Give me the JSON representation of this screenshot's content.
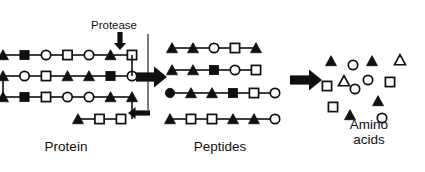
{
  "figure": {
    "stages": [
      {
        "id": "protein",
        "label": "Protein"
      },
      {
        "id": "peptides",
        "label": "Peptides"
      },
      {
        "id": "amino",
        "label": "Amino\nacids"
      }
    ],
    "annotation": {
      "protease_label": "Protease"
    },
    "colors": {
      "filled": "#101010",
      "open_fill": "#ffffff",
      "stroke": "#101010",
      "bond": "#101010",
      "text": "#111111",
      "background": "#ffffff"
    },
    "glyph_legend": [
      {
        "name": "filled-triangle",
        "shape": "triangle",
        "fill": "filled"
      },
      {
        "name": "open-triangle",
        "shape": "triangle",
        "fill": "open"
      },
      {
        "name": "filled-square",
        "shape": "square",
        "fill": "filled"
      },
      {
        "name": "open-square",
        "shape": "square",
        "fill": "open"
      },
      {
        "name": "filled-circle",
        "shape": "circle",
        "fill": "filled"
      },
      {
        "name": "open-circle",
        "shape": "circle",
        "fill": "open"
      }
    ]
  },
  "protein": {
    "rows": [
      {
        "y": 55,
        "x_start": 3,
        "spacing": 21.5,
        "residues": [
          "filled-triangle",
          "filled-square",
          "open-circle",
          "open-square",
          "open-circle",
          "filled-triangle",
          "open-square"
        ]
      },
      {
        "y": 76,
        "x_start": 3,
        "spacing": 21.5,
        "residues": [
          "filled-triangle",
          "open-circle",
          "open-square",
          "filled-triangle",
          "filled-triangle",
          "filled-square",
          "open-circle"
        ]
      },
      {
        "y": 97,
        "x_start": 3,
        "spacing": 21.5,
        "residues": [
          "filled-triangle",
          "filled-square",
          "open-square",
          "open-circle",
          "open-circle",
          "filled-triangle",
          "filled-triangle"
        ]
      },
      {
        "y": 119,
        "x_start": 78,
        "spacing": 21.5,
        "residues": [
          "filled-triangle",
          "open-square",
          "open-square"
        ]
      }
    ],
    "folds": [
      {
        "from_row": 0,
        "to_row": 1,
        "x": 132
      },
      {
        "from_row": 1,
        "to_row": 2,
        "x": 3
      },
      {
        "from_row": 2,
        "to_row": 3,
        "x": 132
      }
    ],
    "protease_arrow": {
      "x": 120,
      "y_top": 32,
      "y_tip": 50,
      "direction": "down"
    },
    "cleavage_arrow": {
      "x_tail": 150,
      "x_tip": 128,
      "y": 113,
      "direction": "left"
    },
    "guide_line": {
      "x": 148,
      "y_top": 34,
      "y_bottom": 110
    }
  },
  "peptides": {
    "rows": [
      {
        "y": 48,
        "x_start": 172,
        "spacing": 21,
        "residues": [
          "filled-triangle",
          "filled-triangle",
          "open-circle",
          "open-square",
          "filled-triangle"
        ]
      },
      {
        "y": 70,
        "x_start": 172,
        "spacing": 21,
        "residues": [
          "filled-triangle",
          "filled-triangle",
          "filled-square",
          "open-circle",
          "open-square"
        ]
      },
      {
        "y": 93,
        "x_start": 170,
        "spacing": 21,
        "residues": [
          "filled-circle",
          "filled-triangle",
          "filled-triangle",
          "filled-square",
          "open-square",
          "open-circle"
        ]
      },
      {
        "y": 119,
        "x_start": 170,
        "spacing": 21,
        "residues": [
          "filled-triangle",
          "open-square",
          "open-square",
          "filled-triangle",
          "filled-triangle",
          "open-circle"
        ]
      }
    ]
  },
  "amino_acids": {
    "items": [
      {
        "glyph": "filled-triangle",
        "x": 331,
        "y": 61
      },
      {
        "glyph": "open-circle",
        "x": 353,
        "y": 65
      },
      {
        "glyph": "filled-triangle",
        "x": 372,
        "y": 61
      },
      {
        "glyph": "open-triangle",
        "x": 400,
        "y": 60
      },
      {
        "glyph": "open-square",
        "x": 327,
        "y": 86
      },
      {
        "glyph": "open-triangle",
        "x": 344,
        "y": 81
      },
      {
        "glyph": "open-circle",
        "x": 368,
        "y": 80
      },
      {
        "glyph": "open-square",
        "x": 390,
        "y": 82
      },
      {
        "glyph": "open-circle",
        "x": 355,
        "y": 89
      },
      {
        "glyph": "open-square",
        "x": 333,
        "y": 107
      },
      {
        "glyph": "filled-triangle",
        "x": 378,
        "y": 101
      },
      {
        "glyph": "filled-triangle",
        "x": 350,
        "y": 115
      },
      {
        "glyph": "open-circle",
        "x": 382,
        "y": 118
      }
    ]
  },
  "transition_arrows": [
    {
      "name": "protein-to-peptides",
      "x_tail": 136,
      "x_tip": 167,
      "y": 77
    },
    {
      "name": "peptides-to-amino",
      "x_tail": 290,
      "x_tip": 322,
      "y": 80
    }
  ]
}
